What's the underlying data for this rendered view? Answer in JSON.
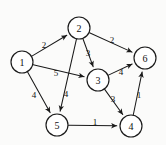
{
  "figure": {
    "background_color": "#fbfbfa",
    "ink_color": "#1a1a1a"
  },
  "chart_data": {
    "type": "diagram",
    "diagram_kind": "directed-weighted-graph",
    "title": "",
    "directed": true,
    "weighted": true,
    "nodes": [
      {
        "id": "1",
        "label": "1",
        "x": 22,
        "y": 62,
        "r": 11
      },
      {
        "id": "2",
        "label": "2",
        "x": 79,
        "y": 28,
        "r": 11
      },
      {
        "id": "3",
        "label": "3",
        "x": 98,
        "y": 80,
        "r": 11
      },
      {
        "id": "4",
        "label": "4",
        "x": 131,
        "y": 126,
        "r": 11
      },
      {
        "id": "5",
        "label": "5",
        "x": 57,
        "y": 125,
        "r": 11
      },
      {
        "id": "6",
        "label": "6",
        "x": 145,
        "y": 58,
        "r": 11
      }
    ],
    "edges": [
      {
        "from": "1",
        "to": "2",
        "weight": "2",
        "label_x": 44,
        "label_y": 45
      },
      {
        "from": "1",
        "to": "3",
        "weight": "5",
        "label_x": 56,
        "label_y": 73
      },
      {
        "from": "1",
        "to": "5",
        "weight": "4",
        "label_x": 34,
        "label_y": 95
      },
      {
        "from": "2",
        "to": "6",
        "weight": "2",
        "label_x": 112,
        "label_y": 40
      },
      {
        "from": "2",
        "to": "3",
        "weight": "3",
        "label_x": 88,
        "label_y": 53
      },
      {
        "from": "2",
        "to": "5",
        "weight": "4",
        "label_x": 66,
        "label_y": 94
      },
      {
        "from": "3",
        "to": "6",
        "weight": "4",
        "label_x": 121,
        "label_y": 72
      },
      {
        "from": "3",
        "to": "4",
        "weight": "3",
        "label_x": 113,
        "label_y": 99
      },
      {
        "from": "5",
        "to": "4",
        "weight": "1",
        "label_x": 95,
        "label_y": 122
      },
      {
        "from": "4",
        "to": "6",
        "weight": "1",
        "label_x": 139,
        "label_y": 95
      }
    ]
  }
}
